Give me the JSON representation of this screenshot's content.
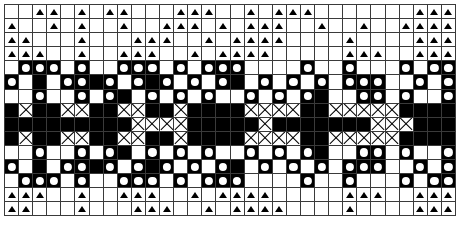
{
  "chart": {
    "type": "grid-pattern",
    "columns": 32,
    "rows": 15,
    "cell_size_px": 14,
    "colors": {
      "background": "#ffffff",
      "foreground": "#000000",
      "gridline": "#3a3a3a"
    },
    "legend": [
      {
        "key": ".",
        "name": "empty-white-cell",
        "background": "#ffffff",
        "symbol": "none"
      },
      {
        "key": "t",
        "name": "triangle-symbol",
        "background": "#ffffff",
        "symbol": "triangle"
      },
      {
        "key": "B",
        "name": "solid-black-cell",
        "background": "#000000",
        "symbol": "none"
      },
      {
        "key": "o",
        "name": "white-dot-on-black",
        "background": "#000000",
        "symbol": "dot"
      },
      {
        "key": "x",
        "name": "cross-on-white",
        "background": "#ffffff",
        "symbol": "x"
      },
      {
        "key": "v",
        "name": "nub-on-white",
        "background": "#ffffff",
        "symbol": "nub"
      }
    ]
  },
  "chart_data": {
    "type": "heatmap",
    "xlabel": "",
    "ylabel": "",
    "grid": true,
    "legend_position": "none",
    "columns": 32,
    "rows": 15,
    "symbol_key": {
      ".": "white empty",
      "t": "white with black triangle",
      "B": "solid black",
      "o": "black with white dot",
      "x": "white with black cross",
      "v": "white with black nub"
    },
    "matrix": [
      "..tt.t.tt...ttt..t.ttt.......ttt",
      "t..t.t..t..ttt.t.ttt..t..t..tttt",
      "tt...t...ttt..t.tttt....t....ttt",
      "ttt..t..ttt..t.tttt.....ttt..ttt",
      ".ooo.o..ooo.o.ooo....o..o...o.oo",
      "o.B.ooBo.oBo.o.oB.o.o.o.ooo..o.o",
      "..o..o.oB.o.o.o..o.o.oB..oo.o..o",
      "BxBBxxBBxxBBxBBBBxxxxBBxxxxxBBBB",
      "BBBBBBBBBxxxxBBBBBxBBBBBBBxxxBBB",
      "BxBBxxBBxxBBxBBBBxxxxBBxxxxxBBBB",
      "..o..o.oB.o.o.o..o.o.oB..oo.o..o",
      "o.B.ooBo.oBo.o.oB.o.o.o.ooo..o.o",
      ".ooo.o..ooo.o.ooo....o..o...o.oo",
      "ttt..t..ttt..t.tttt.....ttt..ttt",
      "tt...t...ttt..t.tttt....t....ttt"
    ]
  }
}
